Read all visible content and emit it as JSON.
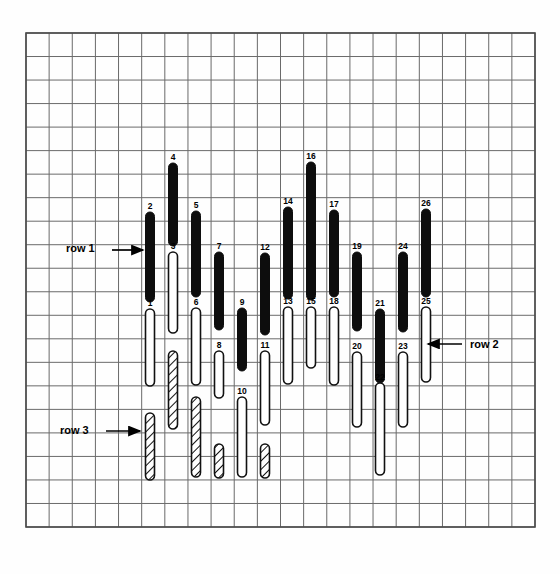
{
  "figure": {
    "title": "",
    "background_color": "#fefefe",
    "grid": {
      "x0": 26,
      "y0": 33,
      "x1": 535,
      "y1": 527,
      "cols": 22,
      "rows": 21,
      "line_color": "#6a6a6a",
      "frame_color": "#4a4a4a",
      "visible": true
    },
    "legend_labels": [
      {
        "id": "row-1",
        "text": "row 1",
        "x": 66,
        "y": 252,
        "arrow": "right",
        "arrow_x1": 112,
        "arrow_x2": 143,
        "arrow_y": 250
      },
      {
        "id": "row-2",
        "text": "row 2",
        "x": 470,
        "y": 348,
        "arrow": "left",
        "arrow_x1": 462,
        "arrow_x2": 428,
        "arrow_y": 344
      },
      {
        "id": "row-3",
        "text": "row 3",
        "x": 60,
        "y": 434,
        "arrow": "right",
        "arrow_x1": 106,
        "arrow_x2": 140,
        "arrow_y": 431
      }
    ]
  },
  "chart_data": {
    "type": "bar",
    "title": "",
    "xlabel": "",
    "ylabel": "",
    "orientation": "vertical-floating",
    "styles": [
      "black",
      "white",
      "hatch"
    ],
    "row_names": [
      "row 1",
      "row 2",
      "row 3"
    ],
    "bar_width": 9,
    "bars": [
      {
        "label": "1",
        "row": 2,
        "style": "white",
        "x": 150,
        "top": 309,
        "bottom": 386
      },
      {
        "label": "2",
        "row": 1,
        "style": "black",
        "x": 150,
        "top": 212,
        "bottom": 302
      },
      {
        "label": "3",
        "row": 1,
        "style": "white",
        "x": 173,
        "top": 252,
        "bottom": 333
      },
      {
        "label": "4",
        "row": 1,
        "style": "black",
        "x": 173,
        "top": 163,
        "bottom": 246
      },
      {
        "label": "5",
        "row": 1,
        "style": "black",
        "x": 196,
        "top": 211,
        "bottom": 297
      },
      {
        "label": "6",
        "row": 2,
        "style": "white",
        "x": 196,
        "top": 308,
        "bottom": 385
      },
      {
        "label": "7",
        "row": 1,
        "style": "black",
        "x": 219,
        "top": 252,
        "bottom": 330
      },
      {
        "label": "8",
        "row": 2,
        "style": "white",
        "x": 219,
        "top": 351,
        "bottom": 398
      },
      {
        "label": "9",
        "row": 2,
        "style": "black",
        "x": 242,
        "top": 308,
        "bottom": 371
      },
      {
        "label": "10",
        "row": 3,
        "style": "white",
        "x": 242,
        "top": 397,
        "bottom": 477
      },
      {
        "label": "11",
        "row": 2,
        "style": "white",
        "x": 265,
        "top": 351,
        "bottom": 425
      },
      {
        "label": "12",
        "row": 1,
        "style": "black",
        "x": 265,
        "top": 253,
        "bottom": 335
      },
      {
        "label": "13",
        "row": 2,
        "style": "white",
        "x": 288,
        "top": 307,
        "bottom": 384
      },
      {
        "label": "14",
        "row": 1,
        "style": "black",
        "x": 288,
        "top": 207,
        "bottom": 299
      },
      {
        "label": "15",
        "row": 1,
        "style": "white",
        "x": 311,
        "top": 307,
        "bottom": 368
      },
      {
        "label": "16",
        "row": 1,
        "style": "black",
        "x": 311,
        "top": 162,
        "bottom": 300
      },
      {
        "label": "17",
        "row": 1,
        "style": "black",
        "x": 334,
        "top": 210,
        "bottom": 297
      },
      {
        "label": "18",
        "row": 2,
        "style": "white",
        "x": 334,
        "top": 307,
        "bottom": 385
      },
      {
        "label": "19",
        "row": 1,
        "style": "black",
        "x": 357,
        "top": 252,
        "bottom": 331
      },
      {
        "label": "20",
        "row": 2,
        "style": "white",
        "x": 357,
        "top": 352,
        "bottom": 427
      },
      {
        "label": "21",
        "row": 2,
        "style": "black",
        "x": 380,
        "top": 309,
        "bottom": 383
      },
      {
        "label": "22",
        "row": 3,
        "style": "white",
        "x": 380,
        "top": 383,
        "bottom": 475
      },
      {
        "label": "23",
        "row": 2,
        "style": "white",
        "x": 403,
        "top": 352,
        "bottom": 427
      },
      {
        "label": "24",
        "row": 1,
        "style": "black",
        "x": 403,
        "top": 252,
        "bottom": 332
      },
      {
        "label": "25",
        "row": 2,
        "style": "white",
        "x": 426,
        "top": 307,
        "bottom": 382
      },
      {
        "label": "26",
        "row": 1,
        "style": "black",
        "x": 426,
        "top": 209,
        "bottom": 297
      },
      {
        "label": "",
        "row": 3,
        "style": "hatch",
        "x": 150,
        "top": 413,
        "bottom": 480
      },
      {
        "label": "",
        "row": 3,
        "style": "hatch",
        "x": 173,
        "top": 351,
        "bottom": 429
      },
      {
        "label": "",
        "row": 3,
        "style": "hatch",
        "x": 196,
        "top": 397,
        "bottom": 477
      },
      {
        "label": "",
        "row": 3,
        "style": "hatch",
        "x": 219,
        "top": 444,
        "bottom": 478
      },
      {
        "label": "",
        "row": 3,
        "style": "hatch",
        "x": 265,
        "top": 444,
        "bottom": 478
      }
    ]
  }
}
